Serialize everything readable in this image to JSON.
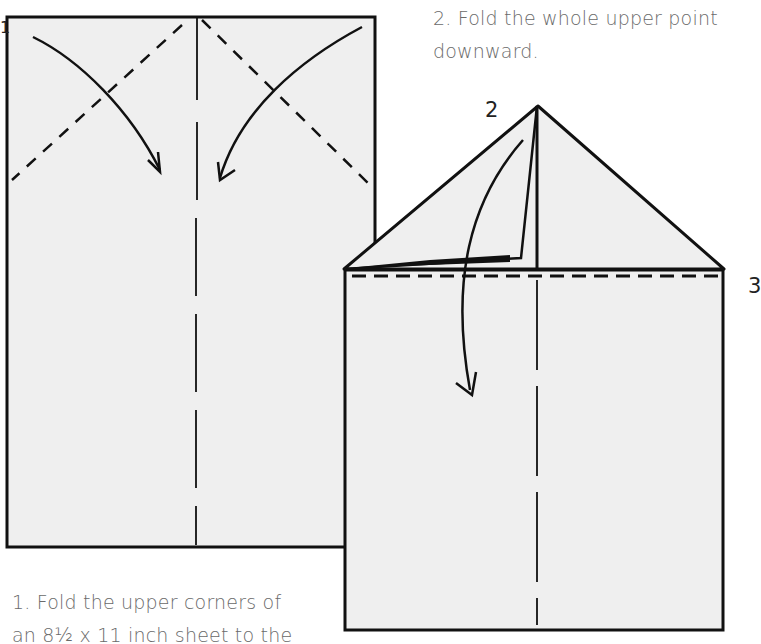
{
  "steps": [
    {
      "number": "1",
      "text_line1": "1. Fold the upper corners of",
      "text_line2": "an 8½ x 11 inch sheet to the"
    },
    {
      "number": "2",
      "text_line1": "2. Fold the whole upper point",
      "text_line2": "downward."
    },
    {
      "number": "3"
    }
  ],
  "colors": {
    "paper": "#efefef",
    "line": "#111111",
    "caption": "#6a6a6a"
  }
}
